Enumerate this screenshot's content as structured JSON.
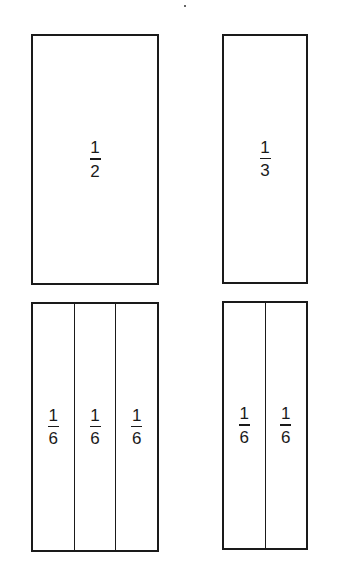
{
  "diagram": {
    "title": "",
    "bars": [
      {
        "id": "half",
        "cells": [
          {
            "numerator": "1",
            "denominator": "2"
          }
        ]
      },
      {
        "id": "third",
        "cells": [
          {
            "numerator": "1",
            "denominator": "3"
          }
        ]
      },
      {
        "id": "three-sixths",
        "cells": [
          {
            "numerator": "1",
            "denominator": "6"
          },
          {
            "numerator": "1",
            "denominator": "6"
          },
          {
            "numerator": "1",
            "denominator": "6"
          }
        ]
      },
      {
        "id": "two-sixths",
        "cells": [
          {
            "numerator": "1",
            "denominator": "6"
          },
          {
            "numerator": "1",
            "denominator": "6"
          }
        ]
      }
    ]
  }
}
